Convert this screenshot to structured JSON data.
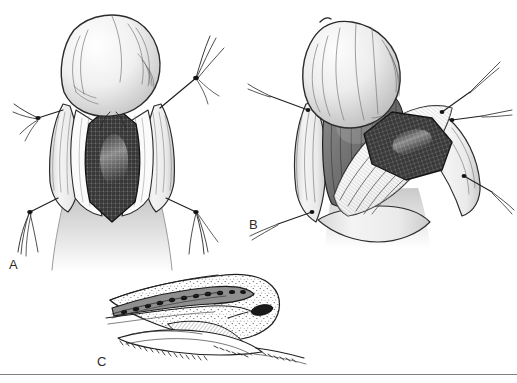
{
  "figure": {
    "medium": "pen-and-ink line drawing with graphite shading",
    "background_color": "#ffffff",
    "ink_color": "#1a1a1a",
    "rule_color": "#7d7d82",
    "width": 517,
    "height": 383,
    "rule": {
      "y": 374,
      "visible": true
    }
  },
  "panels": [
    {
      "id": "A",
      "label": "A",
      "label_x": 9,
      "label_y": 258,
      "caption_text": "A",
      "view": "ventral (frontal) view of shaft with longitudinal incision held open by four stay sutures",
      "bounds": {
        "x": 0,
        "y": 0,
        "width": 250,
        "height": 275
      },
      "elements": [
        {
          "name": "glans",
          "description": "rounded bulbous glans at top with contour hatching"
        },
        {
          "name": "incision-opening",
          "description": "elongated lens-shaped ventral opening"
        },
        {
          "name": "graft-patch",
          "description": "dark cross-hatched mesh graft inlay filling the opening",
          "fill": "#4a4a4a"
        },
        {
          "name": "skin-edge-left",
          "description": "retracted skin flap, left"
        },
        {
          "name": "skin-edge-right",
          "description": "retracted skin flap, right"
        },
        {
          "name": "stay-suture-upper-left",
          "description": "traction suture with knot and loose tails"
        },
        {
          "name": "stay-suture-upper-right",
          "description": "traction suture with knot and loose tails"
        },
        {
          "name": "stay-suture-lower-left",
          "description": "traction suture with knot and loose tails"
        },
        {
          "name": "stay-suture-lower-right",
          "description": "traction suture with knot and loose tails"
        }
      ]
    },
    {
      "id": "B",
      "label": "B",
      "label_x": 249,
      "label_y": 218,
      "caption_text": "B",
      "view": "oblique three-quarter view with tissue layers rotated open and graft laid onto the lateral bed",
      "bounds": {
        "x": 250,
        "y": 0,
        "width": 267,
        "height": 250
      },
      "elements": [
        {
          "name": "glans",
          "description": "tilted glans at upper left with striated shading"
        },
        {
          "name": "dissected-flap",
          "description": "pale fan of dissected tissue with parallel hatching"
        },
        {
          "name": "cavernosal-bed",
          "description": "dark shaded corporal bed beneath the flap"
        },
        {
          "name": "graft-patch",
          "description": "tilted dark cross-hatched mesh graft on the lateral surface",
          "fill": "#4a4a4a"
        },
        {
          "name": "stay-suture-upper-left",
          "description": "traction suture pulled to upper left"
        },
        {
          "name": "stay-suture-upper-right",
          "description": "traction suture pulled to upper right"
        },
        {
          "name": "stay-suture-mid-right",
          "description": "traction suture pulled laterally right"
        },
        {
          "name": "stay-suture-lower-left",
          "description": "traction suture pulled to lower left"
        },
        {
          "name": "stay-suture-lower-right",
          "description": "traction suture pulled to lower right"
        }
      ]
    },
    {
      "id": "C",
      "label": "C",
      "label_x": 97,
      "label_y": 355,
      "caption_text": "C",
      "view": "lateral sagittal section of the distal shaft and glans showing the tubularized graft channel",
      "bounds": {
        "x": 95,
        "y": 265,
        "width": 230,
        "height": 105
      },
      "elements": [
        {
          "name": "shaft-profile",
          "description": "stippled longitudinal profile of the shaft"
        },
        {
          "name": "glans-profile",
          "description": "stippled rounded glans at the right end"
        },
        {
          "name": "graft-channel",
          "description": "dark granular band representing the grafted neourethral channel"
        },
        {
          "name": "meatus",
          "description": "dark elliptical meatal opening at the glans tip"
        },
        {
          "name": "tissue-flap-under",
          "description": "hatched under-surface flaps with serrated cut edges"
        }
      ]
    }
  ]
}
